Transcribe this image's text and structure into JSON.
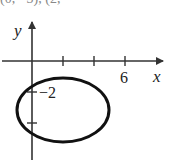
{
  "header_fragment": "(0, −3), (2, −",
  "diagram": {
    "type": "ellipse-graph",
    "axes": {
      "x_label": "x",
      "y_label": "y",
      "x_tick_label": "6",
      "y_tick_label": "−2",
      "origin_px": [
        32,
        61
      ],
      "x_ticks_px": [
        63,
        94,
        125
      ],
      "y_ticks_px": [
        92,
        123
      ],
      "x_arrow_end_px": 165,
      "y_arrow_top_px": 22,
      "y_axis_bottom_px": 160
    },
    "ellipse": {
      "center_px": [
        63,
        110
      ],
      "rx_px": 46,
      "ry_px": 32,
      "stroke": "#111111",
      "stroke_width": 3
    },
    "colors": {
      "axis": "#333333",
      "curve": "#111111",
      "text": "#222222"
    }
  }
}
